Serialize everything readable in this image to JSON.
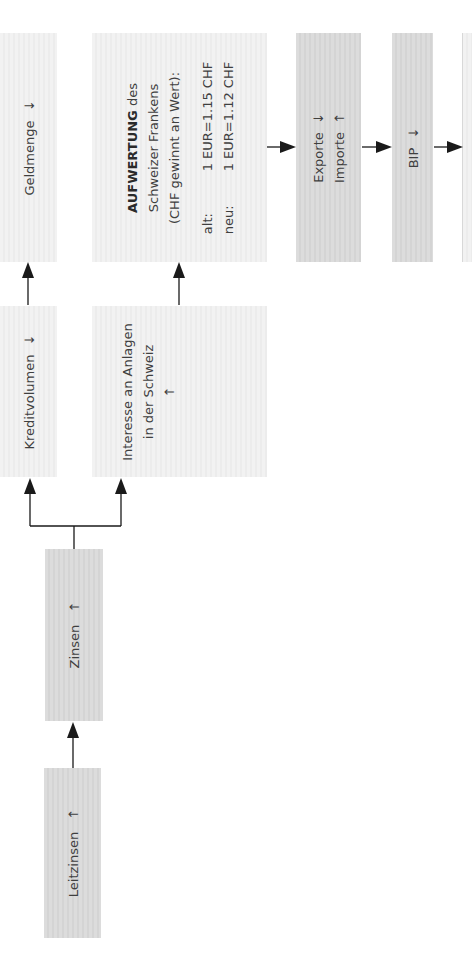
{
  "diagram": {
    "orientation": "rotated-90-ccw",
    "colors": {
      "box_light": "#efefef",
      "box_mid": "#d8d8d8",
      "arrow": "#1a1a1a",
      "text": "#3f3f3f"
    },
    "nodes": {
      "leitzinsen": {
        "label": "Leitzinsen",
        "trend": "↑"
      },
      "zinsen": {
        "label": "Zinsen",
        "trend": "↑"
      },
      "kreditvolumen": {
        "label": "Kreditvolumen",
        "trend": "↓"
      },
      "geldmenge": {
        "label": "Geldmenge",
        "trend": "↓"
      },
      "interesse": {
        "line1": "Interesse an Anlagen",
        "line2": "in der Schweiz",
        "trend": "↑"
      },
      "aufwertung": {
        "title_bold": "AUFWERTUNG",
        "title_rest": " des",
        "line2": "Schweizer Frankens",
        "line3": "(CHF gewinnt an Wert):",
        "rates": [
          {
            "label": "alt:",
            "value": "1 EUR=1.15 CHF"
          },
          {
            "label": "neu:",
            "value": "1 EUR=1.12 CHF"
          }
        ]
      },
      "exporte_importe": {
        "exporte": "Exporte",
        "exporte_trend": "↓",
        "importe": "Importe",
        "importe_trend": "↑"
      },
      "bip": {
        "label": "BIP",
        "trend": "↓"
      }
    },
    "edges": [
      {
        "from": "Leitzinsen",
        "to": "Zinsen"
      },
      {
        "from": "Zinsen",
        "to": "Kreditvolumen"
      },
      {
        "from": "Zinsen",
        "to": "Interesse an Anlagen in der Schweiz"
      },
      {
        "from": "Kreditvolumen",
        "to": "Geldmenge"
      },
      {
        "from": "Interesse an Anlagen in der Schweiz",
        "to": "AUFWERTUNG des Schweizer Frankens"
      },
      {
        "from": "AUFWERTUNG des Schweizer Frankens",
        "to": "Exporte/Importe"
      },
      {
        "from": "Exporte/Importe",
        "to": "BIP"
      },
      {
        "from": "BIP",
        "to": "(cut off)"
      }
    ]
  }
}
